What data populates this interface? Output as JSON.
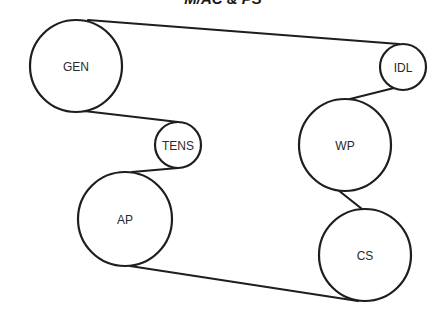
{
  "diagram": {
    "title": "M/AC & PS",
    "type": "serpentine-belt-routing",
    "pulleys": [
      {
        "id": "gen",
        "label": "GEN",
        "cx": 76,
        "cy": 66,
        "r": 46
      },
      {
        "id": "idl",
        "label": "IDL",
        "cx": 403,
        "cy": 67,
        "r": 23
      },
      {
        "id": "tens",
        "label": "TENS",
        "cx": 178,
        "cy": 145,
        "r": 23
      },
      {
        "id": "wp",
        "label": "WP",
        "cx": 345,
        "cy": 145,
        "r": 46
      },
      {
        "id": "ap",
        "label": "AP",
        "cx": 125,
        "cy": 219,
        "r": 47
      },
      {
        "id": "cs",
        "label": "CS",
        "cx": 365,
        "cy": 255,
        "r": 46
      }
    ],
    "belt_segments": [
      {
        "from": "GEN",
        "to": "IDL",
        "desc": "top run"
      },
      {
        "from": "IDL",
        "to": "WP",
        "desc": "idler to water pump"
      },
      {
        "from": "WP",
        "to": "CS",
        "desc": "water pump to crankshaft"
      },
      {
        "from": "CS",
        "to": "AP",
        "desc": "bottom run"
      },
      {
        "from": "AP",
        "to": "TENS",
        "desc": "power steering to tensioner"
      },
      {
        "from": "TENS",
        "to": "GEN",
        "desc": "tensioner to generator"
      }
    ],
    "colors": {
      "stroke": "#1e1e1e",
      "background": "#ffffff",
      "text": "#2a2a2a"
    }
  }
}
